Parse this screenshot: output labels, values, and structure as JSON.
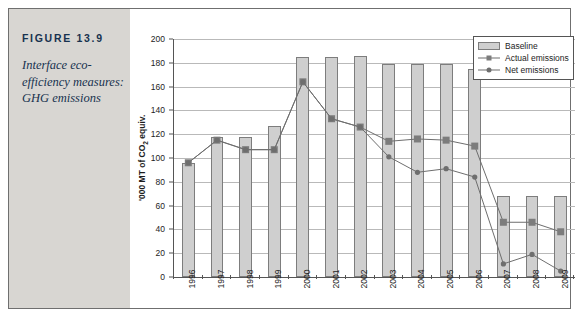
{
  "figure": {
    "number_label": "FIGURE 13.9",
    "caption": "Interface eco-efficiency measures: GHG emissions"
  },
  "colors": {
    "panel_background": "#d8d6d2",
    "caption_text": "#17324f",
    "bar_fill": "#cfcfcf",
    "bar_border": "#7d7d7d",
    "actual_marker": "#7c7c7c",
    "net_marker": "#6e6e6e",
    "line": "#6e6e6e",
    "gridline": "#b9b9b9",
    "axis": "#555555",
    "frame_border": "#6f6f6f"
  },
  "legend": {
    "position": "top-right",
    "entries": [
      {
        "label": "Baseline",
        "key": "bar"
      },
      {
        "label": "Actual emissions",
        "key": "line-square"
      },
      {
        "label": "Net emissions",
        "key": "line-circle"
      }
    ]
  },
  "chart_data": {
    "type": "bar",
    "title": "",
    "subtitle": "",
    "xlabel": "",
    "ylabel": "'000 MT of CO2 equiv.",
    "ylabel_parts": {
      "pre": "'000 MT of CO",
      "sub": "2",
      "post": " equiv."
    },
    "ylim": [
      0,
      200
    ],
    "ytick_step": 20,
    "yticks": [
      0,
      20,
      40,
      60,
      80,
      100,
      120,
      140,
      160,
      180,
      200
    ],
    "grid": true,
    "legend_position": "top-right",
    "categories": [
      "1996",
      "1997",
      "1998",
      "1999",
      "2000",
      "2001",
      "2002",
      "2003",
      "2004",
      "2005",
      "2006",
      "2007",
      "2008",
      "2009"
    ],
    "series": [
      {
        "name": "Baseline",
        "type": "bar",
        "values": [
          96,
          118,
          118,
          127,
          185,
          185,
          186,
          179,
          179,
          179,
          175,
          68,
          68,
          68
        ]
      },
      {
        "name": "Actual emissions",
        "type": "line",
        "marker": "square",
        "values": [
          96,
          115,
          107,
          107,
          164,
          133,
          126,
          114,
          116,
          115,
          110,
          46,
          46,
          38
        ]
      },
      {
        "name": "Net emissions",
        "type": "line",
        "marker": "circle",
        "values": [
          96,
          115,
          107,
          107,
          164,
          133,
          126,
          101,
          88,
          91,
          84,
          11,
          19,
          5
        ]
      }
    ]
  }
}
